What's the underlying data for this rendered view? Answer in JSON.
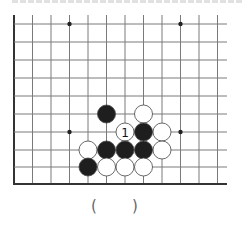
{
  "diagram": {
    "type": "go-board-fragment",
    "title_clipped": true,
    "grid": {
      "x_lines": [
        14,
        32.5,
        51,
        69.5,
        88,
        106.5,
        125,
        143.5,
        162,
        180.5,
        199,
        217.5
      ],
      "y_lines": [
        24,
        42,
        60,
        78,
        96,
        114,
        132,
        150,
        167
      ],
      "left_edge_x": 14,
      "bottom_edge_y": 184,
      "right_extent_x": 227,
      "top_extent_y": 15,
      "line_color": "#7a7a7a",
      "edge_color": "#333333"
    },
    "star_points": [
      {
        "col": 3,
        "row": 0
      },
      {
        "col": 9,
        "row": 0
      },
      {
        "col": 3,
        "row": 6
      },
      {
        "col": 9,
        "row": 6
      }
    ],
    "stones": [
      {
        "color": "black",
        "col": 5,
        "row": 5
      },
      {
        "color": "white",
        "col": 7,
        "row": 5
      },
      {
        "color": "white",
        "col": 6,
        "row": 6,
        "label": "1"
      },
      {
        "color": "black",
        "col": 7,
        "row": 6
      },
      {
        "color": "white",
        "col": 8,
        "row": 6
      },
      {
        "color": "white",
        "col": 4,
        "row": 7
      },
      {
        "color": "black",
        "col": 5,
        "row": 7
      },
      {
        "color": "black",
        "col": 6,
        "row": 7
      },
      {
        "color": "black",
        "col": 7,
        "row": 7
      },
      {
        "color": "white",
        "col": 8,
        "row": 7
      },
      {
        "color": "black",
        "col": 4,
        "row": 8
      },
      {
        "color": "white",
        "col": 5,
        "row": 8
      },
      {
        "color": "white",
        "col": 6,
        "row": 8
      },
      {
        "color": "white",
        "col": 7,
        "row": 8
      }
    ],
    "stone_radius": 9,
    "colors": {
      "black_stone": "#1e1e1e",
      "white_stone": "#ffffff",
      "stone_outline": "#444444"
    }
  },
  "answer": {
    "left_paren": "(",
    "right_paren": ")"
  }
}
